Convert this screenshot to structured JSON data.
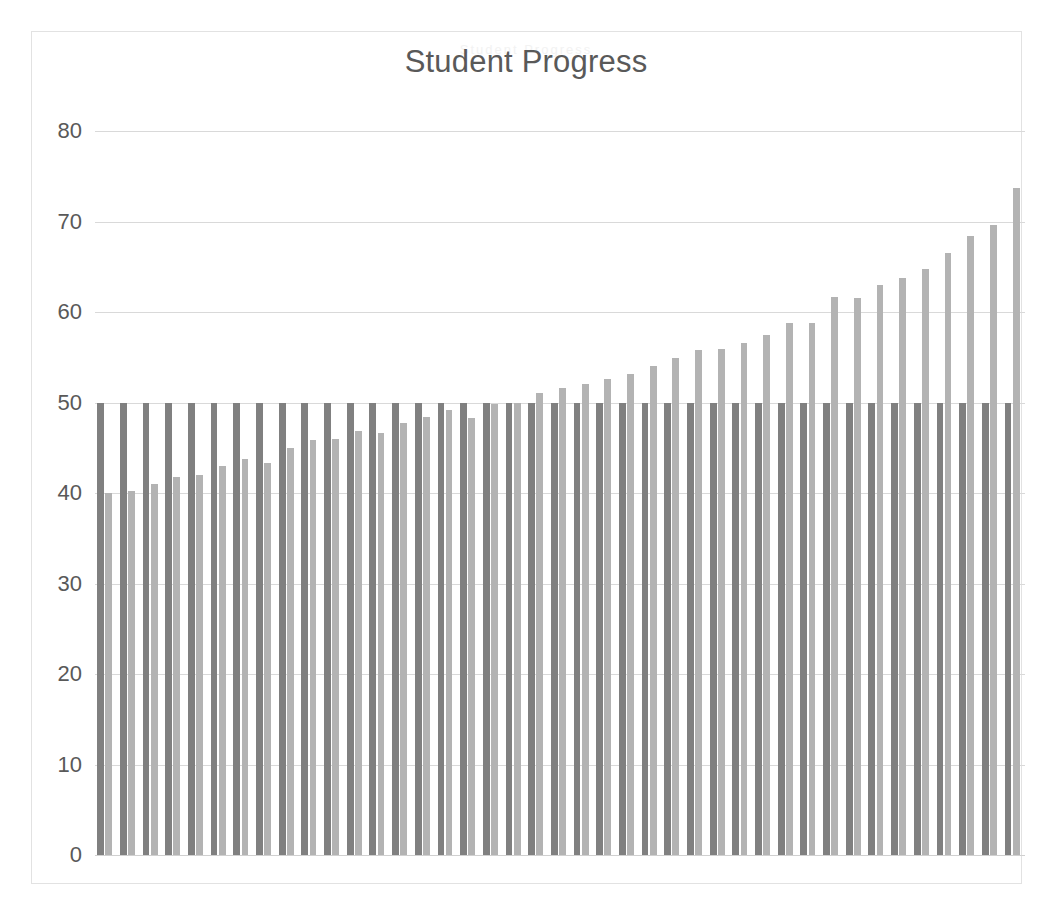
{
  "chart_data": {
    "type": "bar",
    "title": "Student Progress",
    "ghost_title": "Student Progress",
    "xlabel": "",
    "ylabel": "",
    "ylim": [
      0,
      80
    ],
    "yticks": [
      0,
      10,
      20,
      30,
      40,
      50,
      60,
      70,
      80
    ],
    "ytick_labels": [
      "0",
      "10",
      "20",
      "30",
      "40",
      "50",
      "60",
      "70",
      "80"
    ],
    "grid": true,
    "legend": "none",
    "categories": [
      "1",
      "2",
      "3",
      "4",
      "5",
      "6",
      "7",
      "8",
      "9",
      "10",
      "11",
      "12",
      "13",
      "14",
      "15",
      "16",
      "17",
      "18",
      "19",
      "20",
      "21",
      "22",
      "23",
      "24",
      "25",
      "26",
      "27",
      "28",
      "29",
      "30",
      "31",
      "32",
      "33",
      "34",
      "35",
      "36"
    ],
    "series": [
      {
        "name": "Baseline",
        "color": "#808080",
        "values": [
          50,
          50,
          50,
          50,
          50,
          50,
          50,
          50,
          50,
          50,
          50,
          50,
          50,
          50,
          50,
          50,
          50,
          50,
          50,
          50,
          50,
          50,
          50,
          50,
          50,
          50,
          50,
          50,
          50,
          50,
          50,
          50,
          50,
          50,
          50,
          50
        ]
      },
      {
        "name": "Progress",
        "color": "#b3b3b3",
        "values": [
          40.0,
          40.2,
          41.0,
          41.8,
          42.0,
          43.0,
          43.8,
          43.3,
          45.0,
          45.9,
          46.0,
          46.9,
          46.6,
          47.7,
          48.4,
          49.2,
          48.3,
          49.8,
          50.0,
          51.0,
          51.6,
          52.1,
          52.6,
          53.1,
          54.0,
          54.9,
          55.8,
          55.9,
          56.6,
          57.5,
          58.8,
          58.8,
          61.7,
          61.5,
          63.0,
          63.8
        ]
      }
    ],
    "bar_pairs": [
      {
        "baseline": 50,
        "progress": 40.0
      },
      {
        "baseline": 50,
        "progress": 40.2
      },
      {
        "baseline": 50,
        "progress": 41.0
      },
      {
        "baseline": 50,
        "progress": 41.8
      },
      {
        "baseline": 50,
        "progress": 42.0
      },
      {
        "baseline": 50,
        "progress": 43.0
      },
      {
        "baseline": 50,
        "progress": 43.8
      },
      {
        "baseline": 50,
        "progress": 43.3
      },
      {
        "baseline": 50,
        "progress": 45.0
      },
      {
        "baseline": 50,
        "progress": 45.9
      },
      {
        "baseline": 50,
        "progress": 46.0
      },
      {
        "baseline": 50,
        "progress": 46.9
      },
      {
        "baseline": 50,
        "progress": 46.6
      },
      {
        "baseline": 50,
        "progress": 47.7
      },
      {
        "baseline": 50,
        "progress": 48.4
      },
      {
        "baseline": 50,
        "progress": 49.2
      },
      {
        "baseline": 50,
        "progress": 48.3
      },
      {
        "baseline": 50,
        "progress": 49.8
      },
      {
        "baseline": 50,
        "progress": 50.0
      },
      {
        "baseline": 50,
        "progress": 51.0
      },
      {
        "baseline": 50,
        "progress": 51.6
      },
      {
        "baseline": 50,
        "progress": 52.1
      },
      {
        "baseline": 50,
        "progress": 52.6
      },
      {
        "baseline": 50,
        "progress": 53.1
      },
      {
        "baseline": 50,
        "progress": 54.0
      },
      {
        "baseline": 50,
        "progress": 54.9
      },
      {
        "baseline": 50,
        "progress": 55.8
      },
      {
        "baseline": 50,
        "progress": 55.9
      },
      {
        "baseline": 50,
        "progress": 56.6
      },
      {
        "baseline": 50,
        "progress": 57.5
      },
      {
        "baseline": 50,
        "progress": 58.8
      },
      {
        "baseline": 50,
        "progress": 58.8
      },
      {
        "baseline": 50,
        "progress": 61.7
      },
      {
        "baseline": 50,
        "progress": 61.5
      },
      {
        "baseline": 50,
        "progress": 63.0
      },
      {
        "baseline": 50,
        "progress": 63.8
      },
      {
        "baseline": 50,
        "progress": 64.8
      },
      {
        "baseline": 50,
        "progress": 66.5
      },
      {
        "baseline": 50,
        "progress": 68.4
      },
      {
        "baseline": 50,
        "progress": 69.6
      },
      {
        "baseline": 50,
        "progress": 73.7
      }
    ]
  }
}
